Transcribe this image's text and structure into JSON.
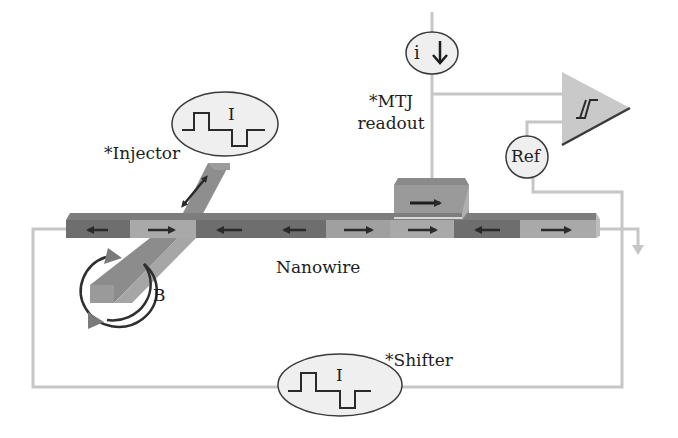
{
  "labels": {
    "injector": "*Injector",
    "mtj_line1": "*MTJ",
    "mtj_line2": "readout",
    "nanowire": "Nanowire",
    "field": "B",
    "shifter": "*Shifter",
    "injector_pulse": "I",
    "shifter_pulse": "I",
    "current_source": "i",
    "reference": "Ref"
  },
  "nanowire_segments": [
    {
      "shade": "dark",
      "direction": "left"
    },
    {
      "shade": "light",
      "direction": "right"
    },
    {
      "shade": "dark",
      "direction": "left"
    },
    {
      "shade": "dark",
      "direction": "left"
    },
    {
      "shade": "light",
      "direction": "right"
    },
    {
      "shade": "light",
      "direction": "right"
    },
    {
      "shade": "dark",
      "direction": "left"
    },
    {
      "shade": "light",
      "direction": "right"
    }
  ],
  "mtj_direction": "right",
  "injector_direction": "bidirectional",
  "colors": {
    "dark_domain": "#6e6e6e",
    "light_domain": "#a9a9a9",
    "wire": "#c4c4c4",
    "ellipse_fill": "#efefef",
    "amplifier_fill": "#c9c9c9",
    "stroke": "#3a3a3a"
  }
}
